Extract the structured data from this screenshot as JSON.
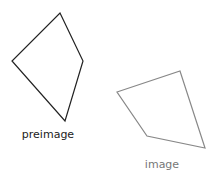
{
  "figure": {
    "preimage": {
      "label": "preimage",
      "stroke_color": "#222222",
      "label_color": "#222222"
    },
    "image": {
      "label": "image",
      "stroke_color": "#888888",
      "label_color": "#777777"
    }
  }
}
